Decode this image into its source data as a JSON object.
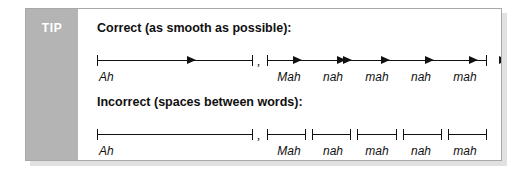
{
  "card": {
    "tip_label": "TIP",
    "rail_color": "#b4b4b4",
    "border_color": "#a8a8a8",
    "background": "#ffffff",
    "ink_color": "#111111"
  },
  "sections": [
    {
      "heading": "Correct (as smooth as possible):",
      "style": "arrows",
      "separator": ",",
      "groups": [
        {
          "name": "ah-group",
          "words": [
            "Ah"
          ],
          "arrow_count": 3,
          "continuous": true
        },
        {
          "name": "mah-nah-group",
          "words": [
            "Mah",
            "nah",
            "mah",
            "nah",
            "mah"
          ],
          "arrow_count": 5,
          "continuous": true
        }
      ]
    },
    {
      "heading": "Incorrect (spaces between words):",
      "style": "brackets",
      "separator": ",",
      "groups": [
        {
          "name": "ah-group",
          "words": [
            "Ah"
          ],
          "arrow_count": 0,
          "continuous": true
        },
        {
          "name": "mah-nah-group",
          "words": [
            "Mah",
            "nah",
            "mah",
            "nah",
            "mah"
          ],
          "arrow_count": 0,
          "continuous": false
        }
      ]
    }
  ]
}
